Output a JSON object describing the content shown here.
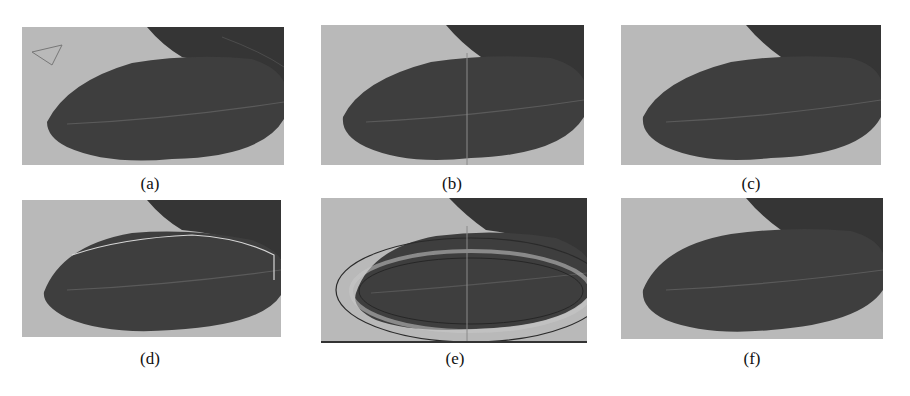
{
  "figure": {
    "colors": {
      "background": "#b9b9b9",
      "leaf": "#3e3e3e",
      "leaf_upper": "#353535",
      "vein": "#6a6a6a",
      "contour_light": "#d8d8d8",
      "contour_dark": "#2a2a2a"
    },
    "panels": [
      {
        "id": "a",
        "caption": "(a)",
        "overlay": "triangle-marker"
      },
      {
        "id": "b",
        "caption": "(b)",
        "overlay": "vertical-line"
      },
      {
        "id": "c",
        "caption": "(c)",
        "overlay": "none"
      },
      {
        "id": "d",
        "caption": "(d)",
        "overlay": "light-contour"
      },
      {
        "id": "e",
        "caption": "(e)",
        "overlay": "double-contour"
      },
      {
        "id": "f",
        "caption": "(f)",
        "overlay": "none"
      }
    ]
  }
}
